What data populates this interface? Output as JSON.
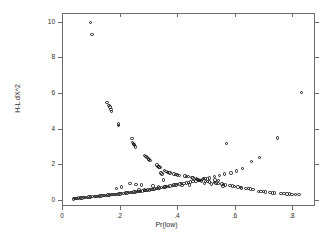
{
  "chart_data": {
    "type": "scatter",
    "title": "",
    "xlabel": "Pr(low)",
    "ylabel": "H-L dX^2",
    "xlim": [
      0.0,
      0.88
    ],
    "ylim": [
      -0.35,
      10.5
    ],
    "xticks": [
      0,
      0.2,
      0.4,
      0.6,
      0.8
    ],
    "xticklabels": [
      "0",
      ".2",
      ".4",
      ".6",
      ".8"
    ],
    "yticks": [
      0,
      2,
      4,
      6,
      8,
      10
    ],
    "yticklabels": [
      "0",
      "2",
      "4",
      "6",
      "8",
      "10"
    ],
    "grid": false,
    "legend": null,
    "marker": "open-circle",
    "marker_color": "#1a1a1a",
    "frame": "box-all-four-sides",
    "series": [
      {
        "name": "H-L dX^2 vs Pr(low)",
        "points": [
          [
            0.1,
            9.97
          ],
          [
            0.104,
            9.3
          ],
          [
            0.156,
            5.48
          ],
          [
            0.164,
            5.3
          ],
          [
            0.167,
            5.22
          ],
          [
            0.17,
            5.08
          ],
          [
            0.172,
            4.95
          ],
          [
            0.196,
            4.26
          ],
          [
            0.197,
            4.18
          ],
          [
            0.243,
            3.45
          ],
          [
            0.246,
            3.22
          ],
          [
            0.248,
            3.15
          ],
          [
            0.25,
            3.1
          ],
          [
            0.252,
            3.05
          ],
          [
            0.255,
            2.97
          ],
          [
            0.288,
            2.5
          ],
          [
            0.292,
            2.42
          ],
          [
            0.296,
            2.36
          ],
          [
            0.3,
            2.3
          ],
          [
            0.303,
            2.26
          ],
          [
            0.306,
            2.2
          ],
          [
            0.33,
            1.95
          ],
          [
            0.334,
            1.88
          ],
          [
            0.338,
            1.84
          ],
          [
            0.341,
            1.8
          ],
          [
            0.356,
            1.66
          ],
          [
            0.362,
            1.6
          ],
          [
            0.368,
            1.55
          ],
          [
            0.372,
            1.52
          ],
          [
            0.376,
            1.5
          ],
          [
            0.39,
            1.44
          ],
          [
            0.396,
            1.42
          ],
          [
            0.402,
            1.4
          ],
          [
            0.408,
            1.38
          ],
          [
            0.352,
            1.12
          ],
          [
            0.428,
            1.34
          ],
          [
            0.434,
            1.32
          ],
          [
            0.44,
            1.31
          ],
          [
            0.452,
            1.25
          ],
          [
            0.456,
            1.22
          ],
          [
            0.47,
            1.14
          ],
          [
            0.474,
            1.12
          ],
          [
            0.478,
            1.1
          ],
          [
            0.482,
            1.08
          ],
          [
            0.486,
            1.06
          ],
          [
            0.5,
            1.04
          ],
          [
            0.506,
            1.02
          ],
          [
            0.512,
            1.0
          ],
          [
            0.53,
            0.96
          ],
          [
            0.536,
            0.94
          ],
          [
            0.542,
            0.92
          ],
          [
            0.556,
            0.88
          ],
          [
            0.562,
            0.86
          ],
          [
            0.568,
            0.84
          ],
          [
            0.584,
            0.8
          ],
          [
            0.592,
            0.78
          ],
          [
            0.612,
            0.72
          ],
          [
            0.62,
            0.7
          ],
          [
            0.648,
            0.62
          ],
          [
            0.656,
            0.6
          ],
          [
            0.664,
            0.58
          ],
          [
            0.684,
            0.48
          ],
          [
            0.692,
            0.46
          ],
          [
            0.7,
            0.45
          ],
          [
            0.708,
            0.44
          ],
          [
            0.724,
            0.4
          ],
          [
            0.732,
            0.39
          ],
          [
            0.74,
            0.38
          ],
          [
            0.762,
            0.35
          ],
          [
            0.772,
            0.34
          ],
          [
            0.782,
            0.33
          ],
          [
            0.792,
            0.32
          ],
          [
            0.832,
            6.02
          ],
          [
            0.75,
            3.48
          ],
          [
            0.572,
            3.18
          ],
          [
            0.688,
            2.38
          ],
          [
            0.66,
            2.14
          ],
          [
            0.628,
            1.76
          ],
          [
            0.606,
            1.62
          ],
          [
            0.588,
            1.5
          ],
          [
            0.566,
            1.44
          ],
          [
            0.548,
            1.36
          ],
          [
            0.53,
            1.3
          ],
          [
            0.512,
            1.22
          ],
          [
            0.498,
            1.18
          ],
          [
            0.488,
            1.14
          ],
          [
            0.478,
            1.1
          ],
          [
            0.466,
            1.06
          ],
          [
            0.456,
            1.04
          ],
          [
            0.448,
            1.0
          ],
          [
            0.44,
            0.98
          ],
          [
            0.432,
            0.94
          ],
          [
            0.424,
            0.92
          ],
          [
            0.416,
            0.9
          ],
          [
            0.41,
            0.88
          ],
          [
            0.402,
            0.86
          ],
          [
            0.396,
            0.84
          ],
          [
            0.39,
            0.82
          ],
          [
            0.384,
            0.8
          ],
          [
            0.376,
            0.78
          ],
          [
            0.37,
            0.76
          ],
          [
            0.364,
            0.74
          ],
          [
            0.358,
            0.72
          ],
          [
            0.352,
            0.7
          ],
          [
            0.346,
            0.68
          ],
          [
            0.34,
            0.66
          ],
          [
            0.334,
            0.64
          ],
          [
            0.328,
            0.62
          ],
          [
            0.322,
            0.6
          ],
          [
            0.316,
            0.58
          ],
          [
            0.31,
            0.57
          ],
          [
            0.304,
            0.55
          ],
          [
            0.298,
            0.54
          ],
          [
            0.292,
            0.52
          ],
          [
            0.286,
            0.51
          ],
          [
            0.28,
            0.5
          ],
          [
            0.274,
            0.48
          ],
          [
            0.268,
            0.47
          ],
          [
            0.262,
            0.46
          ],
          [
            0.256,
            0.44
          ],
          [
            0.25,
            0.43
          ],
          [
            0.244,
            0.42
          ],
          [
            0.238,
            0.41
          ],
          [
            0.232,
            0.4
          ],
          [
            0.226,
            0.38
          ],
          [
            0.22,
            0.37
          ],
          [
            0.214,
            0.36
          ],
          [
            0.208,
            0.34
          ],
          [
            0.202,
            0.33
          ],
          [
            0.196,
            0.32
          ],
          [
            0.19,
            0.31
          ],
          [
            0.184,
            0.3
          ],
          [
            0.178,
            0.29
          ],
          [
            0.172,
            0.28
          ],
          [
            0.166,
            0.27
          ],
          [
            0.16,
            0.26
          ],
          [
            0.154,
            0.25
          ],
          [
            0.148,
            0.24
          ],
          [
            0.142,
            0.23
          ],
          [
            0.136,
            0.22
          ],
          [
            0.13,
            0.21
          ],
          [
            0.124,
            0.2
          ],
          [
            0.118,
            0.19
          ],
          [
            0.112,
            0.18
          ],
          [
            0.106,
            0.17
          ],
          [
            0.1,
            0.16
          ],
          [
            0.094,
            0.15
          ],
          [
            0.088,
            0.14
          ],
          [
            0.082,
            0.13
          ],
          [
            0.076,
            0.12
          ],
          [
            0.07,
            0.11
          ],
          [
            0.064,
            0.1
          ],
          [
            0.058,
            0.09
          ],
          [
            0.052,
            0.08
          ],
          [
            0.048,
            0.07
          ],
          [
            0.044,
            0.06
          ],
          [
            0.04,
            0.05
          ],
          [
            0.236,
            0.92
          ],
          [
            0.258,
            0.86
          ],
          [
            0.276,
            0.82
          ],
          [
            0.206,
            0.72
          ],
          [
            0.19,
            0.62
          ],
          [
            0.316,
            0.78
          ],
          [
            0.336,
            0.76
          ],
          [
            0.358,
            0.74
          ],
          [
            0.268,
            0.56
          ],
          [
            0.288,
            0.54
          ],
          [
            0.496,
            0.9
          ],
          [
            0.52,
            0.88
          ],
          [
            0.418,
            0.8
          ],
          [
            0.444,
            0.84
          ],
          [
            0.624,
            0.66
          ],
          [
            0.64,
            0.64
          ],
          [
            0.8,
            0.31
          ],
          [
            0.812,
            0.3
          ],
          [
            0.824,
            0.3
          ],
          [
            0.56,
            0.78
          ],
          [
            0.6,
            0.74
          ],
          [
            0.468,
            1.18
          ],
          [
            0.492,
            1.2
          ],
          [
            0.506,
            1.16
          ],
          [
            0.532,
            1.12
          ],
          [
            0.544,
            1.08
          ],
          [
            0.344,
            1.5
          ],
          [
            0.348,
            1.45
          ]
        ]
      }
    ]
  }
}
